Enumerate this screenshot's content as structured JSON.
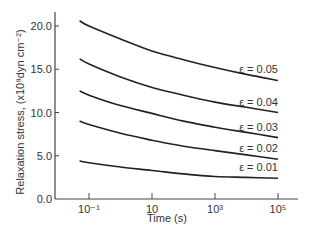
{
  "chart_data": {
    "type": "line",
    "title": "",
    "xlabel": "Time (s)",
    "ylabel": "Relaxation stress, (x10⁸dyn cm⁻²)",
    "xscale": "log",
    "xlim_log10": [
      -1.65,
      5.55
    ],
    "ylim": [
      0,
      22
    ],
    "grid": false,
    "legend": "inline labels at right end of each curve",
    "x_ticks": [
      {
        "log10": -1,
        "label": "10⁻¹"
      },
      {
        "log10": 1,
        "label": "10"
      },
      {
        "log10": 3,
        "label": "10³"
      },
      {
        "log10": 5,
        "label": "10⁵"
      }
    ],
    "y_ticks": [
      {
        "value": 0,
        "label": "0.0"
      },
      {
        "value": 5,
        "label": "5.0"
      },
      {
        "value": 10,
        "label": "10.0"
      },
      {
        "value": 15,
        "label": "15.0"
      },
      {
        "value": 20,
        "label": "20.0"
      }
    ],
    "x_log10": [
      -1.3,
      -1,
      0,
      1,
      2,
      3,
      4,
      5
    ],
    "series": [
      {
        "name": "ε = 0.05",
        "values": [
          20.6,
          20.0,
          18.5,
          17.1,
          16.1,
          15.2,
          14.4,
          13.7
        ]
      },
      {
        "name": "ε = 0.04",
        "values": [
          16.2,
          15.6,
          14.1,
          12.9,
          12.0,
          11.2,
          10.6,
          10.0
        ]
      },
      {
        "name": "ε = 0.03",
        "values": [
          12.5,
          12.0,
          10.8,
          9.9,
          9.0,
          8.3,
          7.7,
          7.1
        ]
      },
      {
        "name": "ε = 0.02",
        "values": [
          9.0,
          8.6,
          7.6,
          6.8,
          6.1,
          5.6,
          5.1,
          4.6
        ]
      },
      {
        "name": "ε = 0.01",
        "values": [
          4.4,
          4.2,
          3.7,
          3.3,
          2.9,
          2.6,
          2.5,
          2.4
        ]
      }
    ]
  },
  "plot": {
    "line_color": "#222222",
    "axis_color": "#444444"
  }
}
